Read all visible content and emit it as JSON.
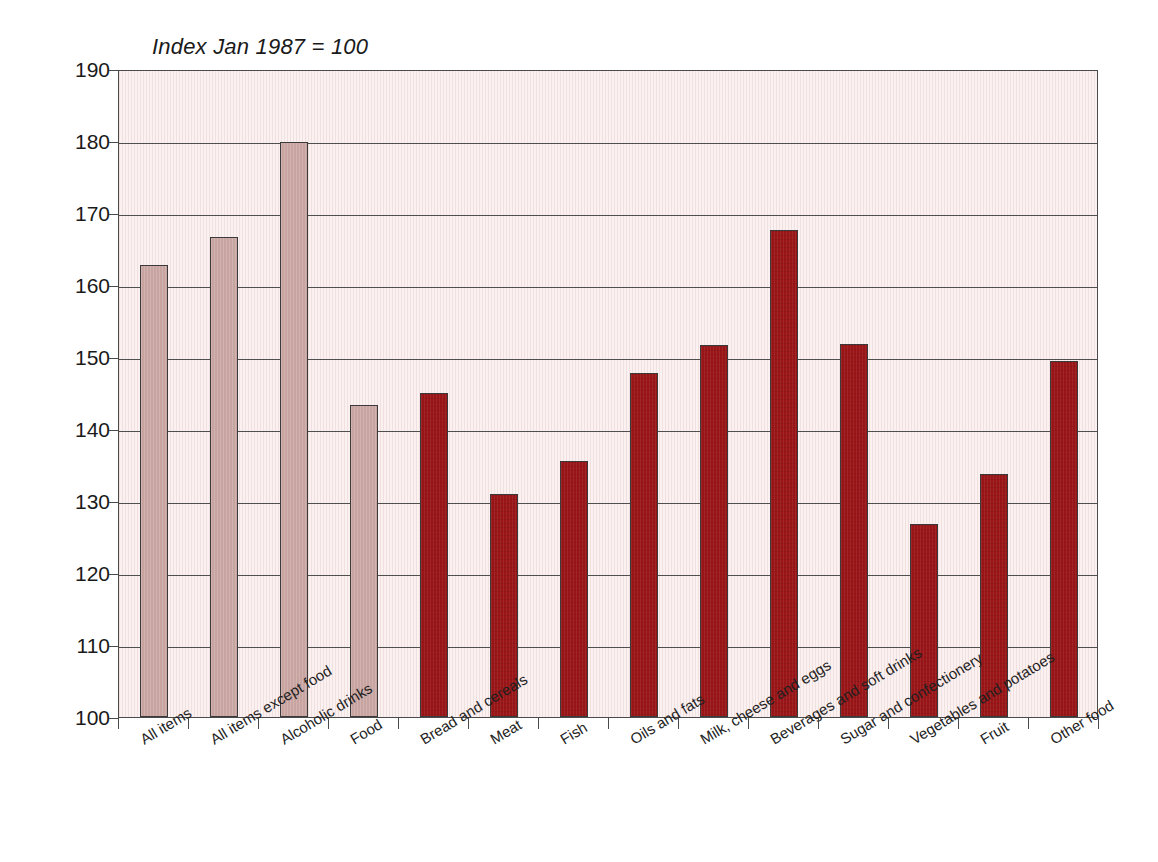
{
  "chart_data": {
    "type": "bar",
    "title": "Index Jan 1987 = 100",
    "xlabel": "",
    "ylabel": "",
    "ylim": [
      100,
      190
    ],
    "ytick_step": 10,
    "yticks": [
      100,
      110,
      120,
      130,
      140,
      150,
      160,
      170,
      180,
      190
    ],
    "grid": true,
    "legend": "none",
    "categories": [
      "All items",
      "All items except food",
      "Alcoholic drinks",
      "Food",
      "Bread and cereals",
      "Meat",
      "Fish",
      "Oils and fats",
      "Milk, cheese and eggs",
      "Beverages and soft drinks",
      "Sugar and confectionery",
      "Vegetables and potatoes",
      "Fruit",
      "Other food"
    ],
    "values": [
      162.8,
      166.6,
      179.8,
      143.3,
      145.0,
      131.0,
      135.5,
      147.8,
      151.7,
      167.7,
      151.8,
      126.8,
      133.8,
      149.4
    ],
    "bar_colors": [
      "pink",
      "pink",
      "pink",
      "pink",
      "red",
      "red",
      "red",
      "red",
      "red",
      "red",
      "red",
      "red",
      "red",
      "red"
    ]
  },
  "colors": {
    "pink_bar": "#c8a4a1",
    "red_bar": "#9a1518",
    "plot_background": "#fbf1f0",
    "axis": "#4a4a4a",
    "gridline": "#4f4f4f",
    "text": "#1a1a1a",
    "page_background": "#ffffff"
  }
}
